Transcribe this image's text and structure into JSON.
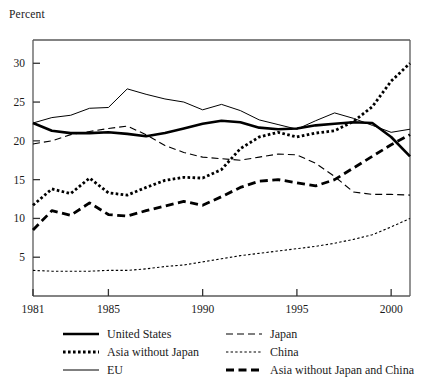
{
  "axis_label": "Percent",
  "chart_data": {
    "type": "line",
    "title": "",
    "xlabel": "",
    "ylabel": "Percent",
    "xlim": [
      1981,
      2001
    ],
    "ylim": [
      0,
      33
    ],
    "xticks": [
      1981,
      1985,
      1990,
      1995,
      2000
    ],
    "xtick_labels": [
      "1981",
      "1985",
      "1990",
      "1995",
      "2000"
    ],
    "yticks": [
      5,
      10,
      15,
      20,
      25,
      30
    ],
    "ytick_labels": [
      "5",
      "10",
      "15",
      "20",
      "25",
      "30"
    ],
    "grid": false,
    "legend_position": "below",
    "x": [
      1981,
      1982,
      1983,
      1984,
      1985,
      1986,
      1987,
      1988,
      1989,
      1990,
      1991,
      1992,
      1993,
      1994,
      1995,
      1996,
      1997,
      1998,
      1999,
      2000,
      2001
    ],
    "series": [
      {
        "name": "United States",
        "style": "thick-solid",
        "color": "#000000",
        "values": [
          22.3,
          21.3,
          21.0,
          21.0,
          21.1,
          20.9,
          20.6,
          21.0,
          21.6,
          22.2,
          22.6,
          22.4,
          21.7,
          21.5,
          21.6,
          22.0,
          22.2,
          22.4,
          22.3,
          20.5,
          18.0
        ]
      },
      {
        "name": "Asia without Japan",
        "style": "thick-dotted",
        "color": "#000000",
        "values": [
          11.7,
          13.8,
          13.2,
          15.2,
          13.3,
          13.0,
          14.0,
          14.9,
          15.3,
          15.2,
          16.3,
          19.0,
          20.5,
          21.1,
          20.5,
          21.0,
          21.3,
          22.5,
          24.4,
          27.7,
          30.0
        ]
      },
      {
        "name": "EU",
        "style": "thin-solid",
        "color": "#000000",
        "values": [
          22.3,
          23.0,
          23.3,
          24.2,
          24.3,
          26.7,
          26.0,
          25.4,
          25.0,
          24.0,
          24.7,
          23.9,
          22.7,
          22.1,
          21.5,
          22.6,
          23.6,
          22.9,
          22.0,
          21.1,
          21.5
        ]
      },
      {
        "name": "Japan",
        "style": "dashed-thin",
        "color": "#000000",
        "values": [
          19.6,
          20.0,
          20.8,
          21.2,
          21.6,
          21.9,
          20.8,
          19.4,
          18.5,
          17.9,
          17.7,
          17.5,
          17.9,
          18.3,
          18.2,
          17.1,
          15.4,
          13.4,
          13.1,
          13.1,
          13.0
        ]
      },
      {
        "name": "China",
        "style": "fine-dotted",
        "color": "#000000",
        "values": [
          3.3,
          3.2,
          3.2,
          3.2,
          3.3,
          3.3,
          3.5,
          3.8,
          4.0,
          4.4,
          4.8,
          5.2,
          5.5,
          5.8,
          6.1,
          6.4,
          6.8,
          7.3,
          7.9,
          8.9,
          10.0
        ]
      },
      {
        "name": "Asia without Japan and China",
        "style": "thick-dashed",
        "color": "#000000",
        "values": [
          8.5,
          11.0,
          10.4,
          12.0,
          10.5,
          10.3,
          11.0,
          11.6,
          12.2,
          11.7,
          12.8,
          14.0,
          14.8,
          15.0,
          14.6,
          14.2,
          15.0,
          16.5,
          18.0,
          19.5,
          20.8
        ]
      }
    ]
  },
  "legend": {
    "left": [
      {
        "label": "United States",
        "key": "thick-solid"
      },
      {
        "label": "Asia without Japan",
        "key": "thick-dotted"
      },
      {
        "label": "EU",
        "key": "thin-solid"
      }
    ],
    "right": [
      {
        "label": "Japan",
        "key": "dashed-thin"
      },
      {
        "label": "China",
        "key": "fine-dotted"
      },
      {
        "label": "Asia without Japan and China",
        "key": "thick-dashed"
      }
    ]
  }
}
